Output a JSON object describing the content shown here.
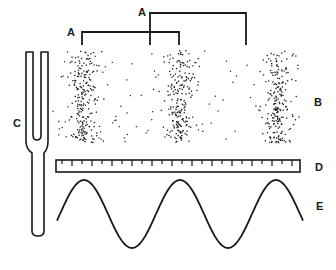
{
  "figure": {
    "labels": {
      "wavelength_1": "A",
      "wavelength_2": "A",
      "compressions": "B",
      "tuning_fork": "C",
      "ruler": "D",
      "wave": "E"
    },
    "colors": {
      "ink": "#1a1a1a",
      "background": "#ffffff"
    }
  },
  "geometry": {
    "bracket_1": {
      "x1": 82,
      "x2": 179,
      "y_top": 32,
      "y_bottom": 45,
      "label_x": 67,
      "label_y": 27
    },
    "bracket_2": {
      "x1": 150,
      "x2": 246,
      "y_top": 13,
      "y_bottom": 45,
      "label_x": 138,
      "label_y": 7
    },
    "particles": {
      "x_min": 52,
      "x_max": 303,
      "y_min": 50,
      "y_max": 142,
      "band_centers": [
        82,
        179,
        276
      ],
      "band_count_dense": 420,
      "background_count": 110
    },
    "ruler": {
      "x": 56,
      "y": 160,
      "width": 244,
      "height": 12,
      "tick_spacing": 10
    },
    "wave": {
      "x_start": 57,
      "x_end": 303,
      "center_y": 214,
      "amplitude": 34,
      "period": 96,
      "peak_x": 84
    },
    "fork": {
      "top": 52,
      "left": 26,
      "right": 48,
      "inner_left": 33,
      "inner_right": 41,
      "inner_bottom": 139,
      "stem_left": 32,
      "stem_right": 44,
      "bottom": 235
    },
    "label_positions": {
      "B": {
        "x": 314,
        "y": 97
      },
      "C": {
        "x": 13,
        "y": 118
      },
      "D": {
        "x": 315,
        "y": 162
      },
      "E": {
        "x": 316,
        "y": 201
      }
    }
  }
}
